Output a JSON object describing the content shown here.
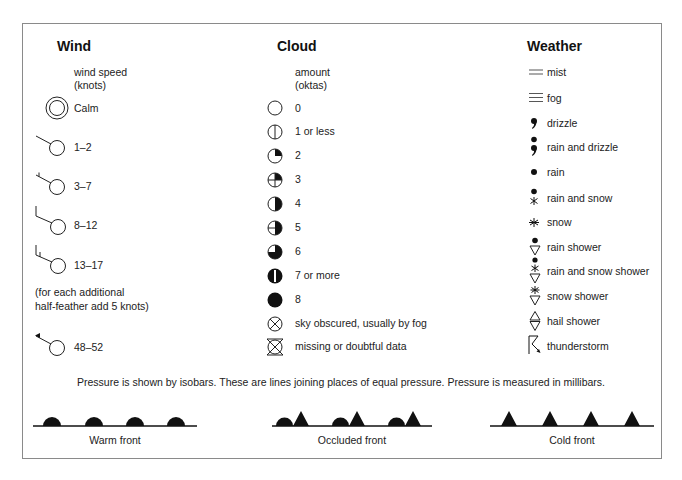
{
  "wind": {
    "heading": "Wind",
    "subtitle_line1": "wind speed",
    "subtitle_line2": "(knots)",
    "items": [
      {
        "symbol": "calm-double-circle-icon",
        "label": "Calm"
      },
      {
        "symbol": "wind-barb-no-feather-icon",
        "label": "1–2"
      },
      {
        "symbol": "wind-barb-half-feather-icon",
        "label": "3–7"
      },
      {
        "symbol": "wind-barb-full-feather-icon",
        "label": "8–12"
      },
      {
        "symbol": "wind-barb-full-and-half-feather-icon",
        "label": "13–17"
      },
      {
        "symbol": "wind-barb-pennant-icon",
        "label": "48–52"
      }
    ],
    "note_line1": "(for each additional",
    "note_line2": "half-feather add 5 knots)"
  },
  "cloud": {
    "heading": "Cloud",
    "subtitle_line1": "amount",
    "subtitle_line2": "(oktas)",
    "items": [
      {
        "symbol": "cloud-0-oktas-icon",
        "label": "0"
      },
      {
        "symbol": "cloud-1-okta-icon",
        "label": "1 or less"
      },
      {
        "symbol": "cloud-2-oktas-icon",
        "label": "2"
      },
      {
        "symbol": "cloud-3-oktas-icon",
        "label": "3"
      },
      {
        "symbol": "cloud-4-oktas-icon",
        "label": "4"
      },
      {
        "symbol": "cloud-5-oktas-icon",
        "label": "5"
      },
      {
        "symbol": "cloud-6-oktas-icon",
        "label": "6"
      },
      {
        "symbol": "cloud-7-oktas-icon",
        "label": "7 or more"
      },
      {
        "symbol": "cloud-8-oktas-icon",
        "label": "8"
      },
      {
        "symbol": "sky-obscured-icon",
        "label": "sky obscured, usually by fog"
      },
      {
        "symbol": "missing-data-icon",
        "label": "missing or doubtful data"
      }
    ]
  },
  "weather": {
    "heading": "Weather",
    "items": [
      {
        "symbol": "mist-icon",
        "label": "mist"
      },
      {
        "symbol": "fog-icon",
        "label": "fog"
      },
      {
        "symbol": "drizzle-icon",
        "label": "drizzle"
      },
      {
        "symbol": "rain-and-drizzle-icon",
        "label": "rain and drizzle"
      },
      {
        "symbol": "rain-icon",
        "label": "rain"
      },
      {
        "symbol": "rain-and-snow-icon",
        "label": "rain and snow"
      },
      {
        "symbol": "snow-icon",
        "label": "snow"
      },
      {
        "symbol": "rain-shower-icon",
        "label": "rain shower"
      },
      {
        "symbol": "rain-and-snow-shower-icon",
        "label": "rain and snow shower"
      },
      {
        "symbol": "snow-shower-icon",
        "label": "snow shower"
      },
      {
        "symbol": "hail-shower-icon",
        "label": "hail shower"
      },
      {
        "symbol": "thunderstorm-icon",
        "label": "thunderstorm"
      }
    ]
  },
  "pressure_note": "Pressure is shown by isobars. These are lines joining places of equal pressure. Pressure is measured in millibars.",
  "fronts": [
    {
      "symbol": "warm-front-icon",
      "label": "Warm front"
    },
    {
      "symbol": "occluded-front-icon",
      "label": "Occluded front"
    },
    {
      "symbol": "cold-front-icon",
      "label": "Cold front"
    }
  ],
  "colors": {
    "ink": "#111111",
    "border": "#8a8a8a",
    "background": "#ffffff"
  }
}
